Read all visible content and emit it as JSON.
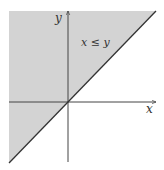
{
  "diagram": {
    "region_label": "x ≤ y",
    "x_axis_label": "x",
    "y_axis_label": "y",
    "colors": {
      "region_fill": "#d3d3d3",
      "axis": "#444444",
      "boundary_line": "#333333",
      "background": "#ffffff"
    },
    "geometry": {
      "origin": [
        68,
        102
      ],
      "region_polygon": [
        [
          9,
          11
        ],
        [
          156,
          11
        ],
        [
          68,
          102
        ],
        [
          9,
          163
        ]
      ],
      "boundary_line": [
        [
          9,
          163
        ],
        [
          156,
          11
        ]
      ],
      "x_axis": [
        [
          9,
          102
        ],
        [
          156,
          102
        ]
      ],
      "y_axis": [
        [
          68,
          162
        ],
        [
          68,
          11
        ]
      ]
    }
  }
}
